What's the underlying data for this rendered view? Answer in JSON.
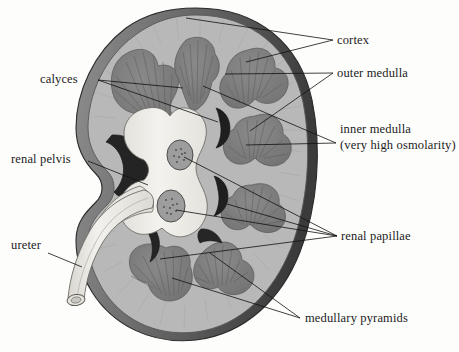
{
  "figure": {
    "background_color": "#fdfdfb"
  },
  "labels": [
    {
      "id": "cortex",
      "text": "cortex",
      "x": 337,
      "y": 44
    },
    {
      "id": "outer-medulla",
      "text": "outer medulla",
      "x": 337,
      "y": 77
    },
    {
      "id": "inner-medulla",
      "text": "inner medulla",
      "x": 340,
      "y": 133
    },
    {
      "id": "inner-medulla-sub",
      "text": "(very high osmolarity)",
      "x": 340,
      "y": 149
    },
    {
      "id": "calyces",
      "text": "calyces",
      "x": 40,
      "y": 83
    },
    {
      "id": "renal-pelvis",
      "text": "renal pelvis",
      "x": 11,
      "y": 163
    },
    {
      "id": "ureter",
      "text": "ureter",
      "x": 11,
      "y": 249
    },
    {
      "id": "renal-papillae",
      "text": "renal papillae",
      "x": 341,
      "y": 240
    },
    {
      "id": "medullary-pyramids",
      "text": "medullary pyramids",
      "x": 305,
      "y": 322
    }
  ],
  "colors": {
    "capsule_dark": "#4a4a4a",
    "capsule_mid": "#6e6e6e",
    "cortex": "#b6b6b6",
    "cortex_light": "#c6c6c6",
    "pyramid": "#7d7d7d",
    "pyramid_dark": "#6a6a6a",
    "pelvis": "#efeeea",
    "pelvis_shade": "#dcdad4",
    "calyx_dark": "#2e2e2e",
    "papilla_fill": "#9a9a9a",
    "ureter_fill": "#e9e7e1",
    "line": "#111111",
    "text": "#1b1b1b"
  },
  "structures": [
    {
      "name": "renal-capsule",
      "description": "dark outer rim of the kidney"
    },
    {
      "name": "renal-cortex",
      "description": "light grey outer parenchyma band"
    },
    {
      "name": "medullary-pyramid",
      "count": 7,
      "description": "darker grey clover shaped pyramids"
    },
    {
      "name": "renal-papilla",
      "count": 2,
      "description": "speckled oval papillae in the pelvis"
    },
    {
      "name": "minor-calyx",
      "count": 4,
      "description": "dark crescent spaces beside pyramids"
    },
    {
      "name": "renal-pelvis",
      "count": 1,
      "description": "pale funnel shaped central cavity"
    },
    {
      "name": "ureter",
      "count": 1,
      "description": "pale tube exiting lower left with open cut end"
    }
  ]
}
